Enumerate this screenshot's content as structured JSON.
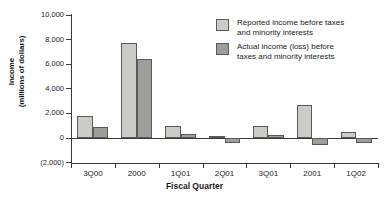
{
  "chart_data": {
    "type": "bar",
    "title": "",
    "xlabel": "Fiscal Quarter",
    "ylabel": "Income\n(millions of dollars)",
    "categories": [
      "3Q00",
      "2000",
      "1Q01",
      "2Q01",
      "3Q01",
      "2001",
      "1Q02"
    ],
    "series": [
      {
        "name": "Reported income before taxes\nand minority interests",
        "color": "#cccbc7",
        "values": [
          1750,
          7750,
          1000,
          150,
          1000,
          2650,
          500
        ]
      },
      {
        "name": "Actual income (loss) before\ntaxes and minority interests",
        "color": "#9d9d9a",
        "values": [
          900,
          6450,
          300,
          -400,
          250,
          -550,
          -400
        ]
      }
    ],
    "ylim": [
      -2000,
      10000
    ],
    "ytick_values": [
      10000,
      8000,
      6000,
      4000,
      2000,
      0,
      -2000
    ],
    "ytick_labels": [
      "10,000",
      "8,000",
      "6,000",
      "4,000",
      "2,000",
      "0",
      "(2,000)"
    ],
    "grid": false,
    "legend_position": "top-right"
  }
}
